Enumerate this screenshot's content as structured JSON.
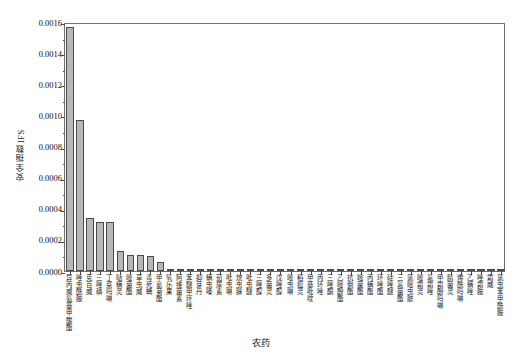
{
  "chart_data": {
    "type": "bar",
    "title": "",
    "xlabel": "农药",
    "ylabel": "安全指数IFS",
    "ylim": [
      0.0,
      0.0016
    ],
    "grid": false,
    "legend": null,
    "ytick_labels": [
      "0.0016",
      "0.0014",
      "0.0012",
      "0.0010",
      "0.0008",
      "0.0006",
      "0.0004",
      "0.0002",
      "0.0000"
    ],
    "ytick_values": [
      0.0016,
      0.0014,
      0.0012,
      0.001,
      0.0008,
      0.0006,
      0.0004,
      0.0002,
      0.0
    ],
    "bar_color": "#b8b8b8",
    "bar_edge_color": "#4a4a4a",
    "categories": [
      "异丙威氨基甲酸酯",
      "唑虫酰胺",
      "克百威",
      "三唑磷",
      "丁菜吗啉",
      "哒螨灵",
      "嘧菌酯",
      "草虫威",
      "毒死蜱",
      "甲氰菊酯",
      "氧乐果",
      "阿维菌素",
      "苯醚甲环唑",
      "抑芽丹",
      "螨虫嗪",
      "茄尿素",
      "吡虫啉",
      "烷虫脒",
      "吡虫醚",
      "三唑醇",
      "多菌灵",
      "戊唑醇",
      "嘧虫啉",
      "稻瘟灵",
      "甲基吡啶",
      "丙环唑",
      "三唑酮",
      "乙嘧酚酯",
      "抗倒酯",
      "嘧菌酯",
      "丙螨酯",
      "环唑酯",
      "硅唑醚",
      "三氟菌酯",
      "氯嘧虫腙",
      "嘧霜灵",
      "氟霜唑",
      "甲霜酚吗啉",
      "腈菌灵",
      "烯酰吗啉",
      "乙螨唑",
      "唑霜胺",
      "霜威",
      "氯虫苯甲酰胺"
    ],
    "values": [
      0.00157,
      0.000968,
      0.000338,
      0.000318,
      0.000318,
      0.000129,
      0.000103,
      0.0001,
      9.8e-05,
      5.5e-05,
      1.6e-05,
      1.2e-05,
      1e-05,
      9e-06,
      8e-06,
      7e-06,
      7e-06,
      6e-06,
      6e-06,
      5e-06,
      5e-06,
      5e-06,
      4e-06,
      4e-06,
      4e-06,
      4e-06,
      3e-06,
      3e-06,
      3e-06,
      3e-06,
      3e-06,
      2e-06,
      2e-06,
      2e-06,
      2e-06,
      2e-06,
      2e-06,
      1e-06,
      1e-06,
      1e-06,
      1e-06,
      1e-06,
      1e-06,
      1e-06
    ]
  }
}
